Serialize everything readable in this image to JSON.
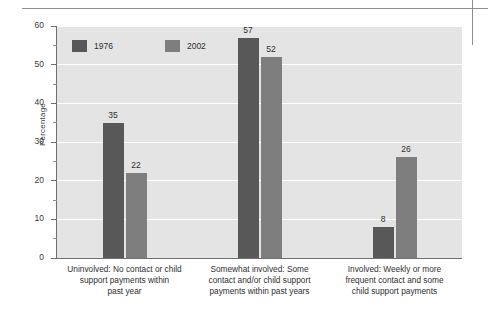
{
  "chart_data": {
    "type": "bar",
    "title": "",
    "xlabel": "",
    "ylabel": "Percentage",
    "ylim": [
      0,
      60
    ],
    "ytick_labels": [
      "0",
      "10",
      "20",
      "30",
      "40",
      "50",
      "60"
    ],
    "ytick_values": [
      0,
      10,
      20,
      30,
      40,
      50,
      60
    ],
    "yminor_step": 5,
    "grid": "horizontal-white-on-gray",
    "legend_position": "top-left-inside",
    "categories": [
      "Uninvolved: No contact or child support payments within past year",
      "Somewhat involved: Some contact and/or child support payments within past years",
      "Involved: Weekly or more frequent contact and some child support payments"
    ],
    "category_lines": [
      [
        "Uninvolved: No contact or child",
        "support payments within",
        "past year"
      ],
      [
        "Somewhat involved: Some",
        "contact and/or child support",
        "payments within past years"
      ],
      [
        "Involved: Weekly or more",
        "frequent contact and some",
        "child support payments"
      ]
    ],
    "series": [
      {
        "name": "1976",
        "color": "#585858",
        "values": [
          35,
          57,
          8
        ]
      },
      {
        "name": "2002",
        "color": "#7e7e7e",
        "values": [
          22,
          52,
          26
        ]
      }
    ]
  },
  "legend": {
    "items": [
      {
        "label": "1976",
        "color": "#585858"
      },
      {
        "label": "2002",
        "color": "#7e7e7e"
      }
    ]
  },
  "axis": {
    "y_title": "Percentage"
  },
  "colors": {
    "plot_background": "#e4e4e4",
    "gridline": "#ffffff",
    "axis": "#6f6f6f",
    "rule": "#8e8e8e",
    "series_1976": "#585858",
    "series_2002": "#7e7e7e"
  }
}
